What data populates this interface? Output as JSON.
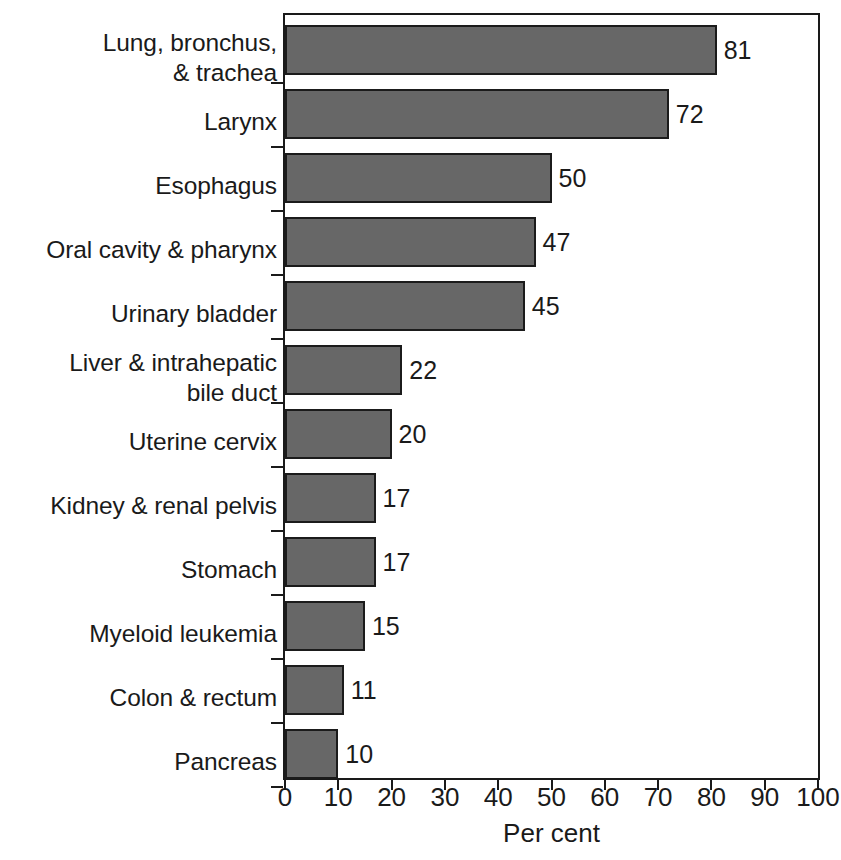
{
  "chart_data": {
    "type": "bar",
    "orientation": "horizontal",
    "title": "",
    "xlabel": "Per cent",
    "ylabel": "",
    "xlim": [
      0,
      100
    ],
    "xticks": [
      0,
      10,
      20,
      30,
      40,
      50,
      60,
      70,
      80,
      90,
      100
    ],
    "xtick_labels": [
      "0",
      "10",
      "20",
      "30",
      "40",
      "50",
      "60",
      "70",
      "80",
      "90",
      "100"
    ],
    "grid": false,
    "legend": null,
    "bar_color": "#676767",
    "bar_edge_color": "#1b1b1b",
    "text_color": "#1a1a1a",
    "categories": [
      "Lung, bronchus,\n& trachea",
      "Larynx",
      "Esophagus",
      "Oral cavity & pharynx",
      "Urinary bladder",
      "Liver & intrahepatic\nbile duct",
      "Uterine cervix",
      "Kidney & renal pelvis",
      "Stomach",
      "Myeloid leukemia",
      "Colon & rectum",
      "Pancreas"
    ],
    "values": [
      81,
      72,
      50,
      47,
      45,
      22,
      20,
      17,
      17,
      15,
      11,
      10
    ],
    "value_labels": [
      "81",
      "72",
      "50",
      "47",
      "45",
      "22",
      "20",
      "17",
      "17",
      "15",
      "11",
      "10"
    ]
  }
}
